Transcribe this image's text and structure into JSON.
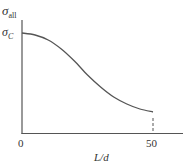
{
  "chart_data": {
    "type": "line",
    "title": "",
    "xlabel": "L/d",
    "ylabel": "σ_all",
    "x_ticks": [
      "0",
      "50"
    ],
    "y_ticks": [
      "σ_C"
    ],
    "xlim": [
      0,
      60
    ],
    "ylim": [
      0,
      1.25
    ],
    "grid": false,
    "legend": null,
    "series": [
      {
        "name": "allowable stress",
        "x": [
          0,
          5,
          10,
          15,
          20,
          25,
          30,
          35,
          40,
          45,
          50
        ],
        "y": [
          1.0,
          0.98,
          0.93,
          0.84,
          0.72,
          0.58,
          0.46,
          0.36,
          0.29,
          0.24,
          0.21
        ]
      }
    ],
    "annotations": [
      {
        "type": "dashed-vertical",
        "x": 50,
        "from_y": 0,
        "to_y": 0.21
      }
    ]
  },
  "labels": {
    "y_axis_symbol": "σ",
    "y_axis_sub": "all",
    "y_tick_symbol": "σ",
    "y_tick_sub": "C",
    "x_tick_0": "0",
    "x_tick_50": "50",
    "x_axis": "L/d"
  }
}
